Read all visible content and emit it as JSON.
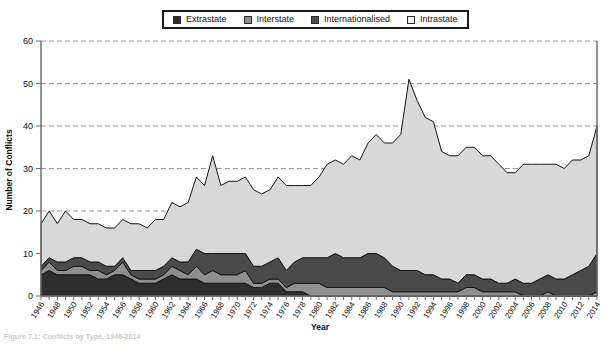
{
  "legend": {
    "position": "top-center",
    "items": [
      {
        "label": "Extrastate",
        "color": "#2e2e2e",
        "key": "extrastate"
      },
      {
        "label": "Interstate",
        "color": "#8f8f8f",
        "key": "interstate"
      },
      {
        "label": "Internationalised",
        "color": "#4a4a4a",
        "key": "internationalised"
      },
      {
        "label": "Intrastate",
        "color": "#d8d8d8",
        "key": "intrastate"
      }
    ]
  },
  "caption": {
    "text": "Figure 7.1: Conflicts by Type, 1946-2014"
  },
  "chart_data": {
    "type": "area",
    "title": "",
    "xlabel": "Year",
    "ylabel": "Number of Conflicts",
    "ylim": [
      0,
      60
    ],
    "yticks": [
      0,
      10,
      20,
      30,
      40,
      50,
      60
    ],
    "grid": true,
    "stacked": true,
    "stack_order": [
      "extrastate",
      "interstate",
      "internationalised",
      "intrastate"
    ],
    "x": [
      1946,
      1947,
      1948,
      1949,
      1950,
      1951,
      1952,
      1953,
      1954,
      1955,
      1956,
      1957,
      1958,
      1959,
      1960,
      1961,
      1962,
      1963,
      1964,
      1965,
      1966,
      1967,
      1968,
      1969,
      1970,
      1971,
      1972,
      1973,
      1974,
      1975,
      1976,
      1977,
      1978,
      1979,
      1980,
      1981,
      1982,
      1983,
      1984,
      1985,
      1986,
      1987,
      1988,
      1989,
      1990,
      1991,
      1992,
      1993,
      1994,
      1995,
      1996,
      1997,
      1998,
      1999,
      2000,
      2001,
      2002,
      2003,
      2004,
      2005,
      2006,
      2007,
      2008,
      2009,
      2010,
      2011,
      2012,
      2013,
      2014
    ],
    "xtick_labels": [
      1946,
      1948,
      1950,
      1952,
      1954,
      1956,
      1958,
      1960,
      1962,
      1964,
      1966,
      1968,
      1970,
      1972,
      1974,
      1976,
      1978,
      1980,
      1982,
      1984,
      1986,
      1988,
      1990,
      1992,
      1994,
      1996,
      1998,
      2000,
      2002,
      2004,
      2006,
      2008,
      2010,
      2012,
      2014
    ],
    "series": [
      {
        "name": "Extrastate",
        "key": "extrastate",
        "color": "#2e2e2e",
        "values": [
          5,
          6,
          5,
          5,
          5,
          5,
          5,
          4,
          4,
          5,
          5,
          4,
          3,
          3,
          3,
          4,
          5,
          4,
          4,
          4,
          3,
          3,
          3,
          3,
          3,
          3,
          2,
          2,
          3,
          3,
          1,
          1,
          1,
          0,
          0,
          0,
          0,
          0,
          0,
          0,
          0,
          0,
          0,
          0,
          0,
          0,
          0,
          0,
          0,
          0,
          0,
          0,
          0,
          0,
          0,
          0,
          0,
          0,
          0,
          0,
          0,
          0,
          0,
          0,
          0,
          0,
          0,
          0,
          0
        ]
      },
      {
        "name": "Interstate",
        "key": "interstate",
        "color": "#8f8f8f",
        "values": [
          1,
          2,
          1,
          1,
          2,
          2,
          1,
          2,
          1,
          1,
          3,
          1,
          1,
          1,
          1,
          1,
          2,
          2,
          1,
          3,
          2,
          3,
          2,
          2,
          2,
          3,
          1,
          1,
          1,
          1,
          1,
          2,
          2,
          3,
          3,
          2,
          2,
          2,
          2,
          2,
          2,
          2,
          2,
          1,
          1,
          1,
          1,
          1,
          1,
          1,
          1,
          1,
          2,
          2,
          1,
          1,
          1,
          1,
          1,
          0,
          0,
          0,
          1,
          0,
          0,
          0,
          0,
          0,
          1
        ]
      },
      {
        "name": "Internationalised",
        "key": "internationalised",
        "color": "#4a4a4a",
        "values": [
          1,
          1,
          2,
          2,
          2,
          2,
          2,
          2,
          2,
          1,
          1,
          1,
          2,
          2,
          2,
          2,
          2,
          2,
          3,
          4,
          5,
          4,
          5,
          5,
          5,
          4,
          4,
          4,
          4,
          5,
          4,
          5,
          6,
          6,
          6,
          7,
          8,
          7,
          7,
          7,
          8,
          8,
          7,
          6,
          5,
          5,
          5,
          4,
          4,
          3,
          3,
          2,
          3,
          3,
          3,
          3,
          2,
          2,
          3,
          3,
          3,
          4,
          4,
          4,
          4,
          5,
          6,
          7,
          9
        ]
      },
      {
        "name": "Intrastate",
        "key": "intrastate",
        "color": "#d8d8d8",
        "values": [
          10,
          11,
          9,
          12,
          9,
          9,
          9,
          9,
          9,
          9,
          9,
          11,
          11,
          10,
          12,
          11,
          13,
          13,
          14,
          17,
          16,
          23,
          16,
          17,
          17,
          18,
          18,
          17,
          17,
          19,
          20,
          18,
          17,
          17,
          19,
          22,
          22,
          22,
          24,
          23,
          26,
          28,
          27,
          29,
          32,
          45,
          40,
          37,
          36,
          30,
          29,
          30,
          30,
          30,
          29,
          29,
          28,
          26,
          25,
          28,
          28,
          27,
          26,
          27,
          26,
          27,
          26,
          26,
          30
        ]
      }
    ]
  }
}
